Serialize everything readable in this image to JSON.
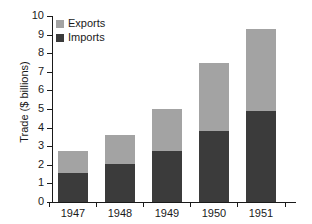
{
  "chart_data": {
    "type": "bar",
    "stacked": true,
    "title": "",
    "xlabel": "",
    "ylabel": "Trade ($ billions)",
    "categories": [
      "1947",
      "1948",
      "1949",
      "1950",
      "1951"
    ],
    "series": [
      {
        "name": "Imports",
        "color": "#3b3b3b",
        "values": [
          1.55,
          2.05,
          2.75,
          3.8,
          4.9
        ]
      },
      {
        "name": "Exports",
        "color": "#a3a3a3",
        "values": [
          1.2,
          1.55,
          2.25,
          3.7,
          4.4
        ]
      }
    ],
    "totals": [
      2.75,
      3.6,
      5.0,
      7.5,
      9.3
    ],
    "ylim": [
      0,
      10
    ],
    "yticks": [
      "0",
      "1",
      "2",
      "3",
      "4",
      "5",
      "6",
      "7",
      "8",
      "9",
      "10"
    ],
    "grid": false,
    "legend_position": "top-left",
    "legend_order": [
      "Exports",
      "Imports"
    ]
  }
}
